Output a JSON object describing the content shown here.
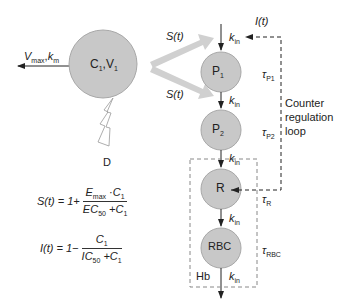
{
  "diagram": {
    "type": "pharmacodynamic model - erythropoiesis with counter regulation",
    "central_compartment": {
      "label_main": "C",
      "label_sub1": "1",
      "label_sep": ",V",
      "label_sub2": "1"
    },
    "elimination": {
      "v": "V",
      "v_sub": "max",
      "sep": ",",
      "k": "k",
      "k_sub": "m"
    },
    "dose": {
      "label": "D"
    },
    "stimulation": {
      "label": "S(t)"
    },
    "inhibition": {
      "label": "I(t)"
    },
    "kin": {
      "k": "k",
      "sub": "in"
    },
    "compartments": [
      {
        "id": "P1",
        "main": "P",
        "sub": "1",
        "tau": "τ",
        "tau_sub": "P1"
      },
      {
        "id": "P2",
        "main": "P",
        "sub": "2",
        "tau": "τ",
        "tau_sub": "P2"
      },
      {
        "id": "R",
        "main": "R",
        "sub": "",
        "tau": "τ",
        "tau_sub": "R"
      },
      {
        "id": "RBC",
        "main": "RBC",
        "sub": "",
        "tau": "τ",
        "tau_sub": "RBC"
      }
    ],
    "hb_box": {
      "label": "Hb"
    },
    "counter_loop": {
      "line1": "Counter",
      "line2": "regulation",
      "line3": "loop"
    },
    "equations": {
      "s": {
        "lhs": "S(t) = 1+",
        "num_a": "E",
        "num_a_sub": "max",
        "num_b": " ·C",
        "num_b_sub": "1",
        "den_a": "EC",
        "den_a_sub": "50",
        "den_b": " +C",
        "den_b_sub": "1"
      },
      "i": {
        "lhs": "I(t) = 1−",
        "num": "C",
        "num_sub": "1",
        "den_a": "IC",
        "den_a_sub": "50",
        "den_b": " +C",
        "den_b_sub": "1"
      }
    },
    "colors": {
      "circle_fill": "#c8c8c8",
      "circle_stroke": "#a8a8a8",
      "arrow_band": "#d0d0d0",
      "line": "#222222"
    }
  }
}
